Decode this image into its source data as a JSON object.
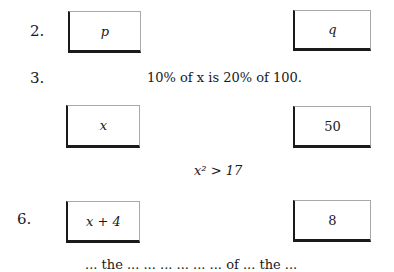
{
  "questions": [
    {
      "number": "2.",
      "column_a": "p",
      "column_b": "q"
    },
    {
      "number": "3.",
      "statement": "10% of x is 20% of 100.",
      "column_a": "x",
      "column_b": "50"
    },
    {
      "statement": "x² > 17"
    },
    {
      "number": "6.",
      "column_a": "x + 4",
      "column_b": "8"
    }
  ],
  "cutoff_text": "... the ... ... ... ... ... ... of ... the ..."
}
